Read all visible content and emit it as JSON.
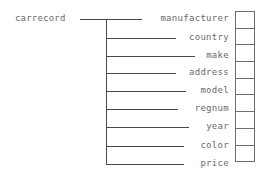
{
  "diagram": {
    "root": "carrecord",
    "fields": [
      {
        "name": "manufacturer"
      },
      {
        "name": "country"
      },
      {
        "name": "make"
      },
      {
        "name": "address"
      },
      {
        "name": "model"
      },
      {
        "name": "regnum"
      },
      {
        "name": "year"
      },
      {
        "name": "color"
      },
      {
        "name": "price"
      }
    ],
    "cell_count": 9
  }
}
